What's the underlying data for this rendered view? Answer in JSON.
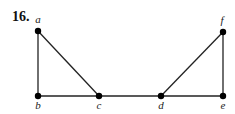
{
  "problem": {
    "number": "16."
  },
  "graph": {
    "vertices": [
      {
        "id": "a",
        "label": "a",
        "x": 38,
        "y": 31,
        "lx": 38,
        "ly": 23
      },
      {
        "id": "b",
        "label": "b",
        "x": 38,
        "y": 96,
        "lx": 38,
        "ly": 109
      },
      {
        "id": "c",
        "label": "c",
        "x": 99,
        "y": 96,
        "lx": 99,
        "ly": 109
      },
      {
        "id": "d",
        "label": "d",
        "x": 161,
        "y": 96,
        "lx": 161,
        "ly": 109
      },
      {
        "id": "e",
        "label": "e",
        "x": 223,
        "y": 96,
        "lx": 223,
        "ly": 109
      },
      {
        "id": "f",
        "label": "f",
        "x": 223,
        "y": 32,
        "lx": 222,
        "ly": 24
      }
    ],
    "edges": [
      [
        "a",
        "b"
      ],
      [
        "a",
        "c"
      ],
      [
        "b",
        "c"
      ],
      [
        "c",
        "d"
      ],
      [
        "d",
        "e"
      ],
      [
        "d",
        "f"
      ],
      [
        "f",
        "e"
      ]
    ]
  }
}
